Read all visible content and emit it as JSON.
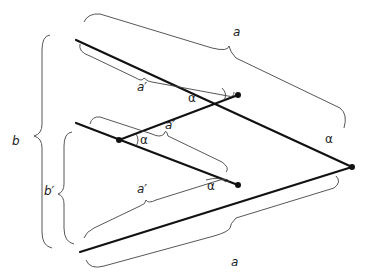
{
  "diagram": {
    "title": "",
    "labels": {
      "a_top": "a",
      "a_bottom": "a",
      "a_prime_upper": "a′",
      "a_prime_middle": "a′",
      "a_prime_lower": "a′",
      "b": "b",
      "b_prime": "b′",
      "alpha_upper": "α",
      "alpha_left": "α",
      "alpha_lower": "α",
      "alpha_apex": "α"
    },
    "line_color": "#111111",
    "brace_color": "#444444"
  }
}
